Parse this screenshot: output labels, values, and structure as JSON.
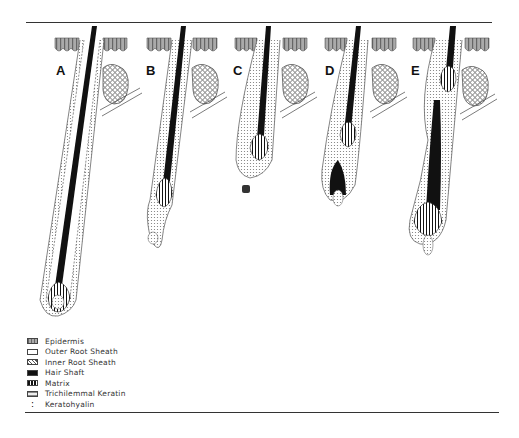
{
  "figure": {
    "panels": [
      {
        "label": "A",
        "stage": "anagen"
      },
      {
        "label": "B",
        "stage": "early catagen"
      },
      {
        "label": "C",
        "stage": "late catagen / telogen"
      },
      {
        "label": "D",
        "stage": "early anagen"
      },
      {
        "label": "E",
        "stage": "anagen with new hair"
      }
    ]
  },
  "legend": {
    "items": [
      {
        "label": "Epidermis",
        "swatch": "epidermis"
      },
      {
        "label": "Outer Root Sheath",
        "swatch": "outer-root-sheath"
      },
      {
        "label": "Inner Root Sheath",
        "swatch": "inner-root-sheath"
      },
      {
        "label": "Hair Shaft",
        "swatch": "hair-shaft"
      },
      {
        "label": "Matrix",
        "swatch": "matrix"
      },
      {
        "label": "Trichilemmal Keratin",
        "swatch": "trichilemmal-keratin"
      },
      {
        "label": "Keratohyalin",
        "swatch": "keratohyalin"
      }
    ]
  },
  "colors": {
    "ink": "#111111",
    "epidermis": "#9a9a9a",
    "background": "#ffffff"
  }
}
